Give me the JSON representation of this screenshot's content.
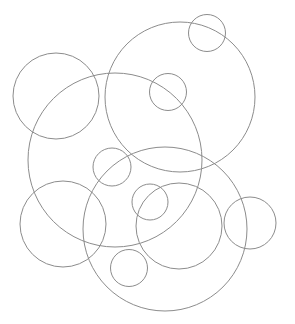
{
  "diagram": {
    "width": 295,
    "height": 324,
    "background": "#ffffff",
    "stroke_color": "#8c8c8c",
    "stroke_width": 1,
    "circles": [
      {
        "id": "top-small",
        "cx": 207,
        "cy": 33,
        "r": 18.5
      },
      {
        "id": "big-upper-right",
        "cx": 180,
        "cy": 97,
        "r": 75
      },
      {
        "id": "left",
        "cx": 56,
        "cy": 96,
        "r": 43
      },
      {
        "id": "upper-center-small",
        "cx": 168,
        "cy": 92,
        "r": 18.5
      },
      {
        "id": "big-middle-left",
        "cx": 115,
        "cy": 160,
        "r": 87
      },
      {
        "id": "middle-small",
        "cx": 112,
        "cy": 167,
        "r": 19
      },
      {
        "id": "big-bottom",
        "cx": 165,
        "cy": 229,
        "r": 82
      },
      {
        "id": "bottom-left",
        "cx": 63,
        "cy": 224,
        "r": 43
      },
      {
        "id": "center-small",
        "cx": 150,
        "cy": 202,
        "r": 18
      },
      {
        "id": "mid-bottom",
        "cx": 179,
        "cy": 226,
        "r": 43
      },
      {
        "id": "right",
        "cx": 250,
        "cy": 223,
        "r": 26
      },
      {
        "id": "bottom-small",
        "cx": 129,
        "cy": 268,
        "r": 18.5
      }
    ]
  }
}
